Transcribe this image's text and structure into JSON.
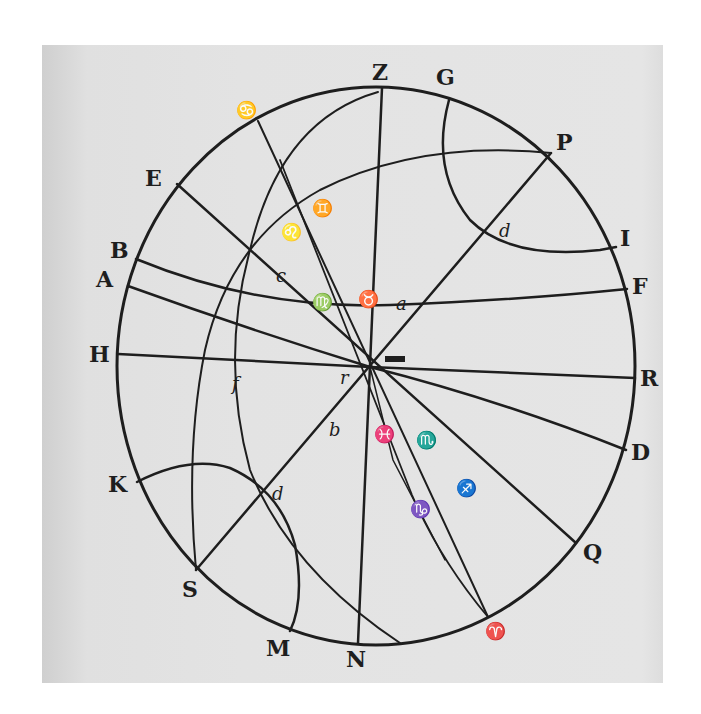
{
  "figure": {
    "type": "astronomical diagram (circle of the sphere with great circles)",
    "outer_labels": {
      "Z": "Z",
      "G": "G",
      "P": "P",
      "I": "I",
      "F": "F",
      "R": "R",
      "D": "D",
      "Q": "Q",
      "aries": "♈",
      "N": "N",
      "M": "M",
      "S": "S",
      "K": "K",
      "H": "H",
      "A": "A",
      "B": "B",
      "E": "E",
      "cancer": "♋"
    },
    "inner_labels": {
      "d_upper": "d",
      "a": "a",
      "taurus": "♉",
      "virgo": "♍",
      "c": "c",
      "leo": "♌",
      "gemini": "♊",
      "libra": "♎",
      "r": "r",
      "f": "f",
      "b": "b",
      "d_lower": "d",
      "pisces": "♓",
      "scorpio": "♏",
      "sagittarius": "♐",
      "capricorn": "♑"
    },
    "colors": {
      "paper": "#e3e3e3",
      "ink": "#1e1e1e",
      "background": "#ffffff"
    }
  }
}
